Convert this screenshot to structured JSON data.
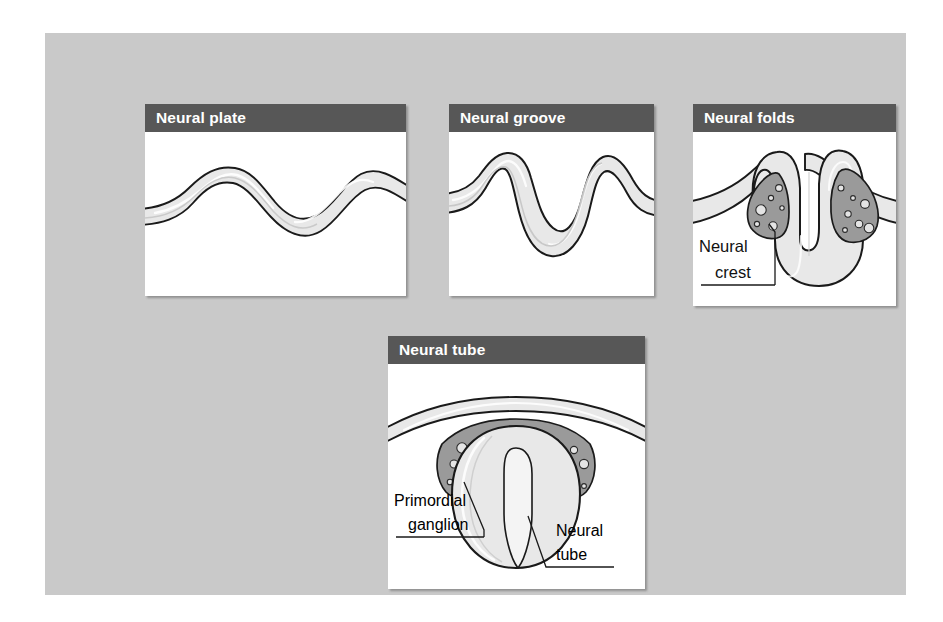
{
  "figure": {
    "background_color": "#c9c9c9",
    "panel_background": "#ffffff",
    "header_color": "#575757",
    "header_text_color": "#ffffff",
    "tissue_fill": "#e8e8e8",
    "crest_fill": "#9a9a9a",
    "outline_color": "#1a1a1a"
  },
  "panels": [
    {
      "id": "neural-plate",
      "header": "Neural plate",
      "labels": []
    },
    {
      "id": "neural-groove",
      "header": "Neural groove",
      "labels": []
    },
    {
      "id": "neural-folds",
      "header": "Neural folds",
      "labels": [
        {
          "line1": "Neural",
          "line2": "crest"
        }
      ]
    },
    {
      "id": "neural-tube",
      "header": "Neural tube",
      "labels": [
        {
          "line1": "Primordial",
          "line2": "ganglion"
        },
        {
          "line1": "Neural",
          "line2": "tube"
        }
      ]
    }
  ]
}
